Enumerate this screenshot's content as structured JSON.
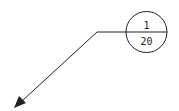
{
  "diagram": {
    "type": "detail-callout-balloon",
    "balloon": {
      "top_text": "1",
      "bottom_text": "20",
      "center": [
        146.5,
        32
      ],
      "radius": 20.5
    },
    "leader": {
      "elbow": [
        97,
        32
      ],
      "tip": [
        15,
        108
      ],
      "has_arrowhead": true
    },
    "colors": {
      "stroke": "#222222",
      "background": "#ffffff"
    }
  }
}
